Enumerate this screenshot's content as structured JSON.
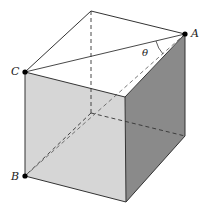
{
  "figure": {
    "colors": {
      "front_face": "#d6d6d6",
      "right_face": "#8a8a8a",
      "top_face": "#ffffff",
      "edge": "#333333",
      "point": "#000000"
    },
    "vertices": {
      "A": [
        185,
        34
      ],
      "C": [
        25,
        72
      ],
      "B": [
        25,
        176
      ],
      "top_back": [
        91,
        11
      ],
      "top_front": [
        125,
        97
      ],
      "bottom_front": [
        126,
        202
      ],
      "bottom_back_right": [
        185,
        136
      ],
      "hidden": [
        91,
        113
      ]
    },
    "labels": {
      "A": "A",
      "B": "B",
      "C": "C",
      "theta": "θ"
    }
  }
}
